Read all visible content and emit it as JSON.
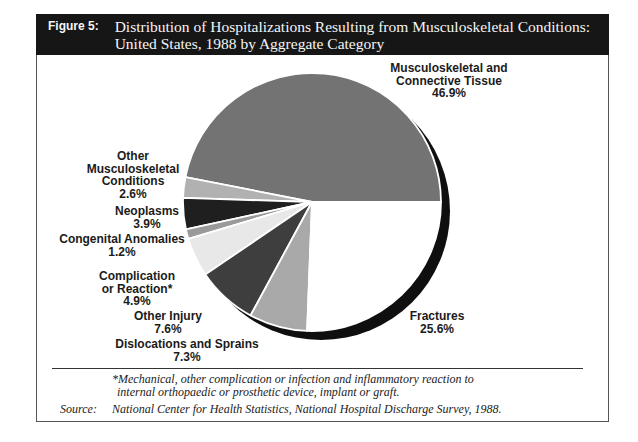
{
  "figure": {
    "tag": "Figure 5:",
    "title_line1": "Distribution of Hospitalizations Resulting from Musculoskeletal Conditions:",
    "title_line2": "United States, 1988 by Aggregate Category"
  },
  "chart_data": {
    "type": "pie",
    "title": "Distribution of Hospitalizations Resulting from Musculoskeletal Conditions: United States, 1988 by Aggregate Category",
    "unit": "%",
    "start_angle_deg": 0,
    "direction": "counterclockwise",
    "legend": false,
    "label_style": "external-callout",
    "shadow_color": "#0f0f0f",
    "separator_color": "#ffffff",
    "slices": [
      {
        "label": "Musculoskeletal and Connective Tissue",
        "value": 46.9,
        "color": "#737373",
        "display_label": "Musculoskeletal and\nConnective Tissue\n46.9%"
      },
      {
        "label": "Other Musculoskeletal Conditions",
        "value": 2.6,
        "color": "#b1b1b1",
        "display_label": "Other\nMusculoskeletal\nConditions\n2.6%"
      },
      {
        "label": "Neoplasms",
        "value": 3.9,
        "color": "#1f1f1f",
        "display_label": "Neoplasms\n3.9%"
      },
      {
        "label": "Congenital Anomalies",
        "value": 1.2,
        "color": "#9a9a9a",
        "display_label": "Congenital Anomalies\n1.2%"
      },
      {
        "label": "Complication or Reaction*",
        "value": 4.9,
        "color": "#e8e8e8",
        "display_label": "Complication\nor Reaction*\n4.9%"
      },
      {
        "label": "Other Injury",
        "value": 7.6,
        "color": "#3e3e3e",
        "display_label": "Other Injury\n7.6%"
      },
      {
        "label": "Dislocations and Sprains",
        "value": 7.3,
        "color": "#a9a9a9",
        "display_label": "Dislocations and Sprains\n7.3%"
      },
      {
        "label": "Fractures",
        "value": 25.6,
        "color": "#ffffff",
        "display_label": "Fractures\n25.6%"
      }
    ]
  },
  "footnote": {
    "line1": "*Mechanical, other complication or infection and inflammatory reaction to",
    "line2": "internal orthopaedic or prosthetic device, implant or graft."
  },
  "source": {
    "label": "Source:",
    "text": "National Center for Health Statistics, National Hospital Discharge Survey, 1988."
  }
}
